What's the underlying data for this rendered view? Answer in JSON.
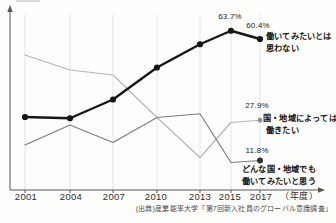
{
  "chart_data": {
    "type": "line",
    "title": "",
    "categories": [
      "2001",
      "2004",
      "2007",
      "2010",
      "2013",
      "2015",
      "2017"
    ],
    "x_axis_unit_label": "（年度）",
    "source": "(出典)産業能率大学「第7回新入社員のグローバル意識調査」",
    "ylim": [
      0,
      70
    ],
    "grid": "vertical-only",
    "legend": "direct-labels-right",
    "series": [
      {
        "name": "働いてみたいとは思わない",
        "name_lines": [
          "働いてみたいとは",
          "思わない"
        ],
        "values": [
          29.2,
          28.7,
          36.2,
          49.0,
          58.3,
          63.7,
          60.4
        ],
        "point_labels": [
          {
            "category": "2015",
            "text": "63.7%"
          },
          {
            "category": "2017",
            "text": "60.4%"
          }
        ],
        "color": "#161616",
        "marker": "all",
        "marker_color": "#161616",
        "stroke_width": 2.4,
        "marker_r": 3.1
      },
      {
        "name": "国・地域によっては働きたい",
        "name_lines": [
          "国・地域によっては",
          "働きたい"
        ],
        "values": [
          54,
          48,
          46,
          29,
          13,
          27,
          27.9
        ],
        "point_labels": [
          {
            "category": "2017",
            "text": "27.9%"
          }
        ],
        "color": "#b5b5b5",
        "marker": "last",
        "marker_color": "#8f8f8f",
        "stroke_width": 1.2,
        "marker_r": 2.4
      },
      {
        "name": "どんな国・地域でも働いてみたいと思う",
        "name_lines": [
          "どんな国・地域でも",
          "働いてみたいと思う"
        ],
        "values": [
          18,
          26,
          19,
          29,
          30.5,
          11,
          11.8
        ],
        "point_labels": [
          {
            "category": "2017",
            "text": "11.8%"
          }
        ],
        "color": "#7d7d7d",
        "marker": "last",
        "marker_color": "#303030",
        "stroke_width": 1.2,
        "marker_r": 3.0
      }
    ]
  }
}
